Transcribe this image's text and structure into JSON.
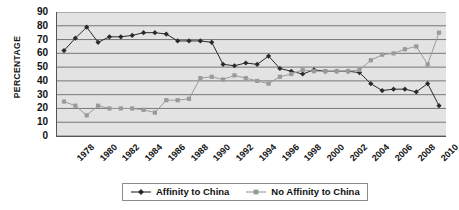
{
  "chart_data": {
    "type": "line",
    "title": "",
    "xlabel": "",
    "ylabel": "PERCENTAGE",
    "ylim": [
      0,
      90
    ],
    "ytick_step": 10,
    "yticks": [
      90,
      80,
      70,
      60,
      50,
      40,
      30,
      20,
      10,
      0
    ],
    "grid": true,
    "grid_axis": "y",
    "legend_position": "bottom",
    "x": [
      1978,
      1979,
      1980,
      1981,
      1982,
      1983,
      1984,
      1985,
      1986,
      1987,
      1988,
      1989,
      1990,
      1991,
      1992,
      1993,
      1994,
      1995,
      1996,
      1997,
      1998,
      1999,
      2000,
      2001,
      2002,
      2003,
      2004,
      2005,
      2006,
      2007,
      2008,
      2009,
      2010,
      2011
    ],
    "xtick_labels": [
      "1978",
      "1980",
      "1982",
      "1984",
      "1986",
      "1988",
      "1990",
      "1992",
      "1994",
      "1996",
      "1998",
      "2000",
      "2002",
      "2004",
      "2006",
      "2008",
      "2010"
    ],
    "xtick_values": [
      1978,
      1980,
      1982,
      1984,
      1986,
      1988,
      1990,
      1992,
      1994,
      1996,
      1998,
      2000,
      2002,
      2004,
      2006,
      2008,
      2010
    ],
    "series": [
      {
        "name": "Affinity to China",
        "color": "#2a2a2a",
        "marker": "diamond",
        "values": [
          62,
          71,
          79,
          68,
          72,
          72,
          73,
          75,
          75,
          74,
          69,
          69,
          69,
          68,
          52,
          51,
          53,
          52,
          58,
          49,
          47,
          45,
          48,
          47,
          47,
          47,
          46,
          38,
          33,
          34,
          34,
          32,
          38,
          22
        ]
      },
      {
        "name": "No Affinity to China",
        "color": "#9a9a9a",
        "marker": "square",
        "values": [
          25,
          22,
          15,
          22,
          20,
          20,
          20,
          19,
          17,
          26,
          26,
          27,
          42,
          43,
          41,
          44,
          42,
          40,
          38,
          43,
          45,
          48,
          47,
          47,
          47,
          47,
          48,
          55,
          59,
          60,
          63,
          65,
          52,
          75
        ]
      }
    ]
  },
  "legend": {
    "items": [
      {
        "label": "Affinity to China"
      },
      {
        "label": "No Affinity to China"
      }
    ]
  },
  "icons": {
    "series1_marker": "diamond-marker-icon",
    "series2_marker": "square-marker-icon"
  }
}
